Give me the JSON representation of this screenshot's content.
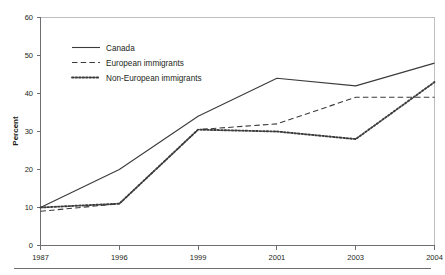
{
  "chart_data": {
    "type": "line",
    "title": "",
    "xlabel": "",
    "ylabel": "Percent",
    "categories": [
      "1987",
      "1996",
      "1999",
      "2001",
      "2003",
      "2004"
    ],
    "ylim": [
      0,
      60
    ],
    "yticks": [
      0,
      10,
      20,
      30,
      40,
      50,
      60
    ],
    "ytick_labels": [
      "0",
      "10",
      "20",
      "30",
      "40",
      "50",
      "60"
    ],
    "grid": false,
    "legend_position": "upper-left-inside",
    "series": [
      {
        "name": "Canada",
        "style": "solid",
        "color": "#3b3b3b",
        "values": [
          10,
          20,
          34,
          44,
          42,
          48
        ]
      },
      {
        "name": "European immigrants",
        "style": "dashed",
        "color": "#3b3b3b",
        "values": [
          9,
          11,
          30.5,
          32,
          39,
          39
        ]
      },
      {
        "name": "Non-European immigrants",
        "style": "dotted",
        "color": "#3b3b3b",
        "values": [
          10,
          11,
          30.5,
          30,
          28,
          43
        ]
      }
    ]
  },
  "axis": {
    "y_title": "Percent",
    "tick_0": "0",
    "tick_10": "10",
    "tick_20": "20",
    "tick_30": "30",
    "tick_40": "40",
    "tick_50": "50",
    "tick_60": "60",
    "x_1": "1987",
    "x_2": "1996",
    "x_3": "1999",
    "x_4": "2001",
    "x_5": "2003",
    "x_6": "2004"
  },
  "legend": {
    "item_1": "Canada",
    "item_2": "European immigrants",
    "item_3": "Non-European immigrants"
  },
  "colors": {
    "ink": "#231f20",
    "series": "#3b3b3b",
    "axis": "#6d6e71",
    "frame": "#bcbec0",
    "background": "#ffffff"
  }
}
